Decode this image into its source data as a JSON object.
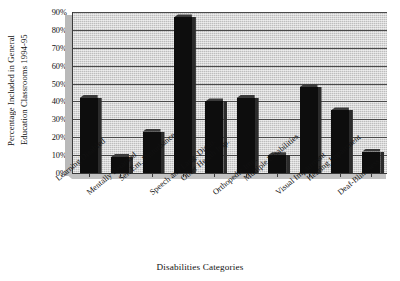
{
  "chart_data": {
    "type": "bar",
    "title": "",
    "xlabel": "Disabilities Categories",
    "ylabel": "Percentage Included in General Education Classrooms 1994-95",
    "ylabel_lines": [
      "Percentage Included in General",
      "Education Classrooms 1994-95"
    ],
    "categories": [
      "Learning Disabled",
      "Mentally Retarded",
      "Ser. Em. Disturbance",
      "Speech and Lang. Disab.",
      "Other Health Imp.",
      "Orthopedic Imp.",
      "Multiple Disabilities",
      "Visual Impairment",
      "Hearing Impairment",
      "Deaf-Blindness"
    ],
    "values": [
      42,
      9,
      23,
      87,
      40,
      42,
      10,
      48,
      35,
      12
    ],
    "ylim": [
      0,
      90
    ],
    "ytick_values": [
      0,
      10,
      20,
      30,
      40,
      50,
      60,
      70,
      80,
      90
    ],
    "ytick_labels": [
      "0%",
      "10%",
      "20%",
      "30%",
      "40%",
      "50%",
      "60%",
      "70%",
      "80%",
      "90%"
    ],
    "grid": true,
    "legend": "none",
    "bar_color": "#0d0d0d",
    "plot_background": "#bdbdbd",
    "axis_color": "#3a3a3a"
  }
}
